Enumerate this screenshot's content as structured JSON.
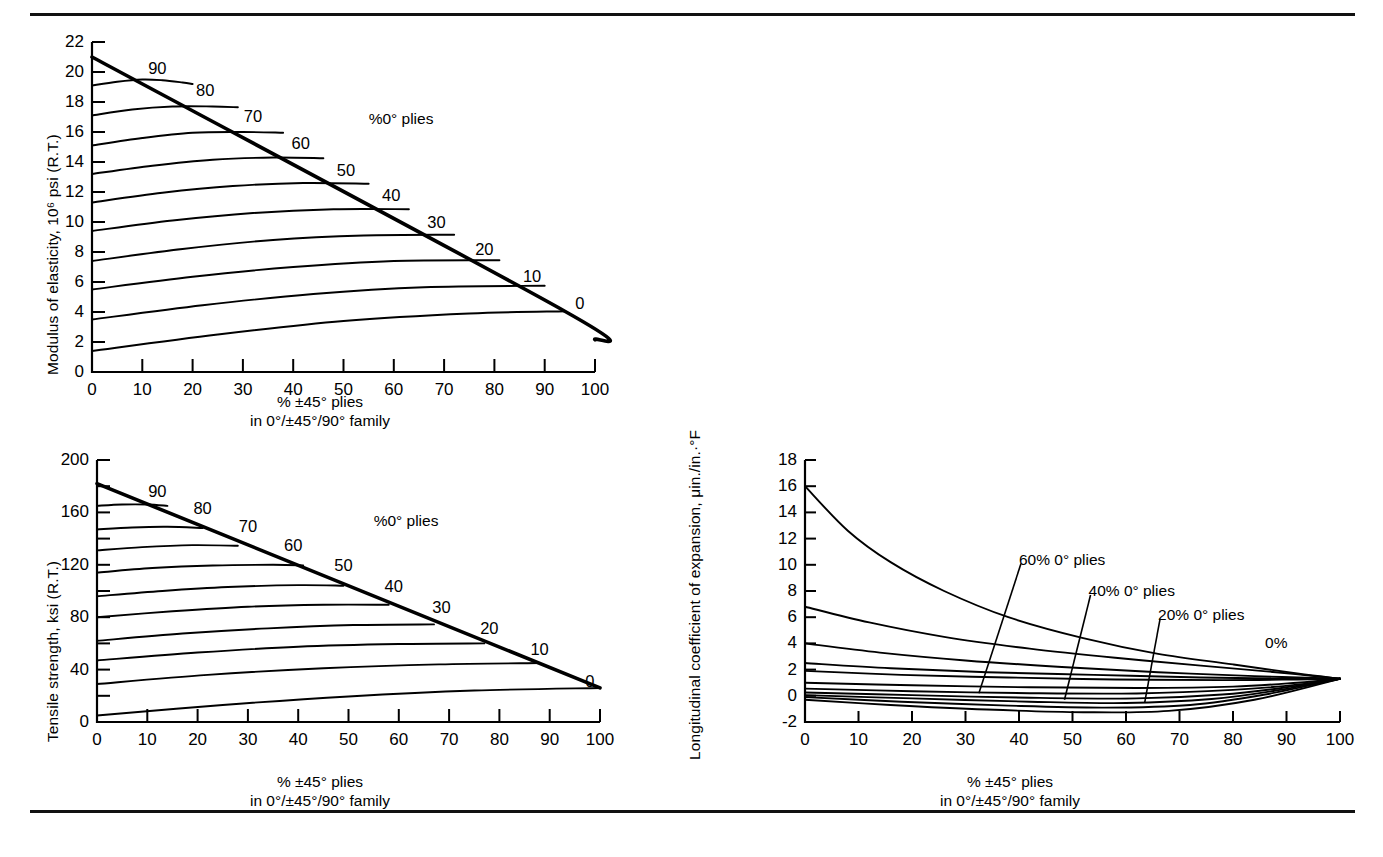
{
  "figure": {
    "title_rules": [
      "top-rule",
      "bottom-rule"
    ],
    "background": "#ffffff",
    "ink": "#000000"
  },
  "chart_data": [
    {
      "id": "modulus",
      "type": "line",
      "title": "",
      "ylabel": "Modulus of elasticity, 10⁶ psi (R.T.)",
      "xlabel_line1": "% ±45° plies",
      "xlabel_line2": "in 0°/±45°/90° family",
      "xlim": [
        0,
        100
      ],
      "ylim": [
        0,
        22
      ],
      "xticks": [
        0,
        10,
        20,
        30,
        40,
        50,
        60,
        70,
        80,
        90,
        100
      ],
      "yticks": [
        0,
        2,
        4,
        6,
        8,
        10,
        12,
        14,
        16,
        18,
        20,
        22
      ],
      "xtick_labels": [
        "0",
        "10",
        "20",
        "30",
        "40",
        "50",
        "60",
        "70",
        "80",
        "90",
        "100"
      ],
      "ytick_labels": [
        "0",
        "2",
        "4",
        "6",
        "8",
        "10",
        "12",
        "14",
        "16",
        "18",
        "20",
        "22"
      ],
      "grid": false,
      "legend": "none",
      "annotation": "%0° plies",
      "annotation_x": 55,
      "annotation_y": 17.5,
      "envelope_label": "%0° plies envelope",
      "series": [
        {
          "name": "100",
          "label": "",
          "x": [
            0
          ],
          "y": [
            21.0
          ]
        },
        {
          "name": "90",
          "label": "90",
          "label_x": 13,
          "label_y": 20.3,
          "x": [
            0,
            5,
            10,
            14,
            18,
            20
          ],
          "y": [
            19.1,
            19.35,
            19.5,
            19.45,
            19.3,
            19.2
          ]
        },
        {
          "name": "80",
          "label": "80",
          "label_x": 22.5,
          "label_y": 18.8,
          "x": [
            0,
            8,
            16,
            24,
            29
          ],
          "y": [
            17.1,
            17.5,
            17.7,
            17.7,
            17.65
          ]
        },
        {
          "name": "70",
          "label": "70",
          "label_x": 32,
          "label_y": 17.1,
          "x": [
            0,
            10,
            20,
            30,
            38
          ],
          "y": [
            15.1,
            15.6,
            15.95,
            16.0,
            15.95
          ]
        },
        {
          "name": "60",
          "label": "60",
          "label_x": 41.5,
          "label_y": 15.3,
          "x": [
            0,
            12,
            24,
            36,
            46
          ],
          "y": [
            13.2,
            13.75,
            14.15,
            14.3,
            14.25
          ]
        },
        {
          "name": "50",
          "label": "50",
          "label_x": 50.5,
          "label_y": 13.5,
          "x": [
            0,
            14,
            28,
            42,
            55
          ],
          "y": [
            11.3,
            11.95,
            12.4,
            12.6,
            12.55
          ]
        },
        {
          "name": "40",
          "label": "40",
          "label_x": 59.5,
          "label_y": 11.8,
          "x": [
            0,
            16,
            32,
            48,
            63
          ],
          "y": [
            9.4,
            10.1,
            10.6,
            10.85,
            10.85
          ]
        },
        {
          "name": "30",
          "label": "30",
          "label_x": 68.5,
          "label_y": 10.0,
          "x": [
            0,
            18,
            36,
            54,
            72
          ],
          "y": [
            7.4,
            8.2,
            8.8,
            9.1,
            9.15
          ]
        },
        {
          "name": "20",
          "label": "20",
          "label_x": 78,
          "label_y": 8.2,
          "x": [
            0,
            20,
            40,
            60,
            81
          ],
          "y": [
            5.5,
            6.35,
            7.0,
            7.4,
            7.45
          ]
        },
        {
          "name": "10",
          "label": "10",
          "label_x": 87.5,
          "label_y": 6.4,
          "x": [
            0,
            22,
            44,
            66,
            90
          ],
          "y": [
            3.5,
            4.45,
            5.2,
            5.65,
            5.75
          ]
        },
        {
          "name": "0",
          "label": "0",
          "label_x": 97,
          "label_y": 4.6,
          "x": [
            0,
            25,
            50,
            75,
            94
          ],
          "y": [
            1.4,
            2.5,
            3.4,
            3.9,
            4.05
          ]
        }
      ],
      "envelope": {
        "x": [
          0,
          94,
          100
        ],
        "y": [
          21.0,
          4.05,
          2.15
        ]
      }
    },
    {
      "id": "tensile",
      "type": "line",
      "title": "",
      "ylabel": "Tensile strength, ksi (R.T.)",
      "xlabel_line1": "% ±45° plies",
      "xlabel_line2": "in 0°/±45°/90° family",
      "xlim": [
        0,
        100
      ],
      "ylim": [
        0,
        200
      ],
      "xticks": [
        0,
        10,
        20,
        30,
        40,
        50,
        60,
        70,
        80,
        90,
        100
      ],
      "yticks": [
        0,
        20,
        40,
        60,
        80,
        100,
        120,
        140,
        160,
        180,
        200
      ],
      "xtick_labels": [
        "0",
        "10",
        "20",
        "30",
        "40",
        "50",
        "60",
        "70",
        "80",
        "90",
        "100"
      ],
      "ytick_labels_major": {
        "0": "0",
        "40": "40",
        "80": "80",
        "120": "120",
        "160": "160",
        "200": "200"
      },
      "grid": false,
      "legend": "none",
      "annotation": "%0° plies",
      "annotation_x": 55,
      "annotation_y": 160,
      "series": [
        {
          "name": "100",
          "label": "",
          "x": [
            0
          ],
          "y": [
            182
          ]
        },
        {
          "name": "90",
          "label": "90",
          "label_x": 12,
          "label_y": 176,
          "x": [
            0,
            5,
            10,
            14
          ],
          "y": [
            165,
            166,
            166,
            165
          ]
        },
        {
          "name": "80",
          "label": "80",
          "label_x": 21,
          "label_y": 163,
          "x": [
            0,
            7,
            14,
            21
          ],
          "y": [
            147,
            148.5,
            149,
            148
          ]
        },
        {
          "name": "70",
          "label": "70",
          "label_x": 30,
          "label_y": 150,
          "x": [
            0,
            9,
            19,
            28
          ],
          "y": [
            131,
            133.5,
            135,
            134.5
          ]
        },
        {
          "name": "60",
          "label": "60",
          "label_x": 39,
          "label_y": 135,
          "x": [
            0,
            11,
            23,
            35,
            41
          ],
          "y": [
            114,
            117.5,
            119.5,
            120,
            119.5
          ]
        },
        {
          "name": "50",
          "label": "50",
          "label_x": 49,
          "label_y": 120,
          "x": [
            0,
            13,
            26,
            40,
            49
          ],
          "y": [
            96,
            100,
            103,
            104.5,
            104
          ]
        },
        {
          "name": "40",
          "label": "40",
          "label_x": 59,
          "label_y": 104,
          "x": [
            0,
            15,
            30,
            45,
            58
          ],
          "y": [
            80,
            84.5,
            88,
            89.5,
            89.5
          ]
        },
        {
          "name": "30",
          "label": "30",
          "label_x": 68.5,
          "label_y": 88,
          "x": [
            0,
            17,
            34,
            51,
            67
          ],
          "y": [
            62,
            67.5,
            71.5,
            74,
            74.5
          ]
        },
        {
          "name": "20",
          "label": "20",
          "label_x": 78,
          "label_y": 72,
          "x": [
            0,
            20,
            40,
            60,
            77
          ],
          "y": [
            47,
            53,
            57.5,
            59.5,
            60
          ]
        },
        {
          "name": "10",
          "label": "10",
          "label_x": 88,
          "label_y": 56,
          "x": [
            0,
            22,
            45,
            68,
            88
          ],
          "y": [
            29,
            36,
            41,
            44,
            45
          ]
        },
        {
          "name": "0",
          "label": "0",
          "label_x": 98,
          "label_y": 31,
          "x": [
            0,
            25,
            50,
            75,
            100
          ],
          "y": [
            5,
            13,
            19.5,
            24,
            26
          ]
        }
      ],
      "envelope": {
        "x": [
          0,
          100
        ],
        "y": [
          182,
          26
        ]
      }
    },
    {
      "id": "cte",
      "type": "line",
      "title": "",
      "ylabel": "Longitudinal coefficient of expansion, μin./in.·°F",
      "xlabel_line1": "% ±45° plies",
      "xlabel_line2": "in 0°/±45°/90° family",
      "xlim": [
        0,
        100
      ],
      "ylim": [
        -2,
        18
      ],
      "xticks": [
        0,
        10,
        20,
        30,
        40,
        50,
        60,
        70,
        80,
        90,
        100
      ],
      "yticks": [
        -2,
        0,
        2,
        4,
        6,
        8,
        10,
        12,
        14,
        16,
        18
      ],
      "xtick_labels": [
        "0",
        "10",
        "20",
        "30",
        "40",
        "50",
        "60",
        "70",
        "80",
        "90",
        "100"
      ],
      "ytick_labels": [
        "-2",
        "0",
        "2",
        "4",
        "6",
        "8",
        "10",
        "12",
        "14",
        "16",
        "18"
      ],
      "grid": false,
      "legend": "none",
      "annotations": [
        {
          "text": "60% 0° plies",
          "x": 40,
          "y": 10.4,
          "leader_to_x": 32.5,
          "leader_to_y": 0.2
        },
        {
          "text": "40% 0° plies",
          "x": 53,
          "y": 8.0,
          "leader_to_x": 48.5,
          "leader_to_y": -0.3
        },
        {
          "text": "20% 0° plies",
          "x": 66,
          "y": 6.2,
          "leader_to_x": 63.5,
          "leader_to_y": -0.5
        },
        {
          "text": "0%",
          "x": 86,
          "y": 4.0
        }
      ],
      "series": [
        {
          "name": "0% ±45 (100% 0°)",
          "x": [
            0,
            8,
            16,
            26,
            38,
            52,
            66,
            80,
            92,
            100
          ],
          "y": [
            16.0,
            12.6,
            10.2,
            8.0,
            6.0,
            4.4,
            3.2,
            2.4,
            1.7,
            1.3
          ]
        },
        {
          "name": "80% 0°",
          "x": [
            0,
            12,
            26,
            42,
            58,
            74,
            88,
            100
          ],
          "y": [
            6.8,
            5.6,
            4.5,
            3.6,
            2.9,
            2.3,
            1.8,
            1.3
          ]
        },
        {
          "name": "60% 0°",
          "x": [
            0,
            14,
            30,
            48,
            66,
            84,
            100
          ],
          "y": [
            4.0,
            3.3,
            2.7,
            2.2,
            1.8,
            1.5,
            1.3
          ]
        },
        {
          "name": "40% 0°",
          "x": [
            0,
            16,
            34,
            54,
            74,
            90,
            100
          ],
          "y": [
            2.5,
            2.1,
            1.8,
            1.6,
            1.4,
            1.3,
            1.3
          ]
        },
        {
          "name": "20% 0°",
          "x": [
            0,
            18,
            38,
            58,
            78,
            92,
            100
          ],
          "y": [
            1.9,
            1.6,
            1.4,
            1.25,
            1.2,
            1.25,
            1.3
          ]
        },
        {
          "name": "lower-1",
          "x": [
            0,
            20,
            42,
            62,
            80,
            92,
            100
          ],
          "y": [
            1.0,
            0.8,
            0.65,
            0.6,
            0.7,
            1.0,
            1.3
          ]
        },
        {
          "name": "lower-2",
          "x": [
            0,
            20,
            42,
            62,
            80,
            92,
            100
          ],
          "y": [
            0.55,
            0.35,
            0.2,
            0.18,
            0.45,
            0.85,
            1.3
          ]
        },
        {
          "name": "lower-3",
          "x": [
            0,
            20,
            42,
            62,
            78,
            90,
            100
          ],
          "y": [
            0.25,
            0.05,
            -0.15,
            -0.2,
            0.1,
            0.65,
            1.3
          ]
        },
        {
          "name": "lower-4",
          "x": [
            0,
            20,
            42,
            60,
            76,
            88,
            100
          ],
          "y": [
            0.05,
            -0.2,
            -0.45,
            -0.55,
            -0.25,
            0.4,
            1.3
          ]
        },
        {
          "name": "lower-5",
          "x": [
            0,
            18,
            38,
            56,
            72,
            86,
            100
          ],
          "y": [
            -0.1,
            -0.45,
            -0.75,
            -0.9,
            -0.7,
            0.1,
            1.3
          ]
        },
        {
          "name": "lower-6",
          "x": [
            0,
            16,
            34,
            52,
            68,
            84,
            100
          ],
          "y": [
            -0.3,
            -0.7,
            -1.05,
            -1.25,
            -1.15,
            -0.3,
            1.3
          ]
        }
      ]
    }
  ]
}
